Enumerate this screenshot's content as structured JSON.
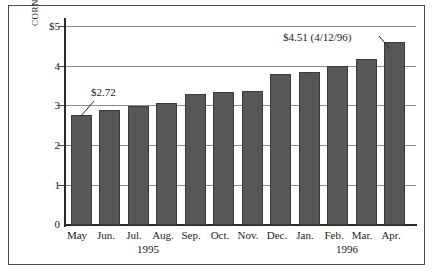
{
  "chart_data": {
    "type": "bar",
    "title": "",
    "subtitle": "",
    "xlabel": "",
    "ylabel": "CORN",
    "categories": [
      "May",
      "Jun.",
      "Jul.",
      "Aug.",
      "Sep.",
      "Oct.",
      "Nov.",
      "Dec.",
      "Jan.",
      "Feb.",
      "Mar.",
      "Apr."
    ],
    "values": [
      2.72,
      2.83,
      2.92,
      3.0,
      3.22,
      3.27,
      3.3,
      3.72,
      3.76,
      3.92,
      4.1,
      4.51
    ],
    "ylim": [
      0,
      5
    ],
    "yticks": [
      0,
      1,
      2,
      3,
      4,
      5
    ],
    "ytick_labels": [
      "0",
      "1",
      "2",
      "3",
      "4",
      "$5"
    ],
    "grid": true,
    "legend": "none",
    "group_labels": [
      {
        "text": "1995",
        "span_start": "May",
        "span_end": "Oct."
      },
      {
        "text": "1996",
        "span_start": "Jan.",
        "span_end": "Apr."
      }
    ],
    "annotations": [
      {
        "text": "$2.72",
        "points_to": "May",
        "value": 2.72
      },
      {
        "text": "$4.51 (4/12/96)",
        "points_to": "Apr.",
        "value": 4.51
      }
    ]
  },
  "colors": {
    "bar_fill": "#575757",
    "bar_stroke": "#3a3a3a",
    "gridline": "#8e8e8e",
    "axis": "#2b2b2b",
    "frame": "#4a4a4a",
    "text": "#1a1a1a",
    "background": "#ffffff"
  }
}
